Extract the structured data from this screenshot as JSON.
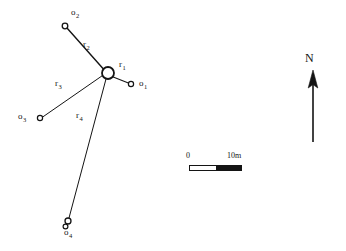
{
  "figure": {
    "stroke_color": "#141414",
    "background_color": "#ffffff"
  },
  "diagram": {
    "center_node": {
      "name": "central-station",
      "cx": 108,
      "cy": 73,
      "r": 6.0
    },
    "nodes": [
      {
        "id": "o1",
        "label": "o",
        "subscript": "1",
        "cx": 131,
        "cy": 84,
        "r": 2.6,
        "label_x": 139,
        "label_y": 79
      },
      {
        "id": "o2",
        "label": "o",
        "subscript": "2",
        "cx": 65,
        "cy": 26,
        "r": 2.8,
        "label_x": 71,
        "label_y": 8
      },
      {
        "id": "o3",
        "label": "o",
        "subscript": "3",
        "cx": 40,
        "cy": 118,
        "r": 2.6,
        "label_x": 18,
        "label_y": 112
      },
      {
        "id": "o4",
        "label": "o",
        "subscript": "4",
        "cx": 68,
        "cy": 221,
        "r": 3.0,
        "label_x": 64,
        "label_y": 228
      }
    ],
    "radii": [
      {
        "id": "r1",
        "label": "r",
        "subscript": "1",
        "from": "center",
        "to": "o1",
        "label_x": 119,
        "label_y": 60,
        "style": "solid"
      },
      {
        "id": "r2",
        "label": "r",
        "subscript": "2",
        "from": "center",
        "to": "o2",
        "label_x": 83,
        "label_y": 40,
        "style": "solid"
      },
      {
        "id": "r3",
        "label": "r",
        "subscript": "3",
        "from": "center",
        "to": "o3",
        "label_x": 55,
        "label_y": 79,
        "style": "solid"
      },
      {
        "id": "r4",
        "label": "r",
        "subscript": "4",
        "from": "center",
        "to": "o4",
        "label_x": 76,
        "label_y": 111,
        "style": "solid"
      }
    ]
  },
  "scale_bar": {
    "name": "scale-bar",
    "left_label": "0",
    "right_label": "10m",
    "units": "m",
    "length_value": 10
  },
  "north_arrow": {
    "name": "north-arrow",
    "label": "N"
  }
}
